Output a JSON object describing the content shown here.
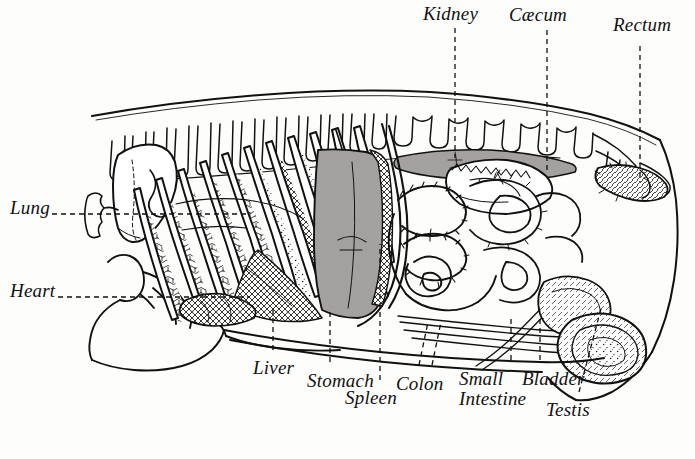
{
  "figure": {
    "background_color": "#fdfdfb",
    "ink_color": "#121110",
    "width": 695,
    "height": 459,
    "style": "engraved line drawing, italic serif labels with dashed leader lines"
  },
  "labels": [
    {
      "id": "kidney",
      "text": "Kidney",
      "x": 423,
      "y": 4,
      "align": "left"
    },
    {
      "id": "caecum",
      "text": "Cæcum",
      "x": 509,
      "y": 5,
      "align": "left"
    },
    {
      "id": "rectum",
      "text": "Rectum",
      "x": 613,
      "y": 15,
      "align": "left"
    },
    {
      "id": "lung",
      "text": "Lung",
      "x": 10,
      "y": 198,
      "align": "left"
    },
    {
      "id": "heart",
      "text": "Heart",
      "x": 10,
      "y": 281,
      "align": "left"
    },
    {
      "id": "liver",
      "text": "Liver",
      "x": 253,
      "y": 358,
      "align": "left"
    },
    {
      "id": "stomach",
      "text": "Stomach",
      "x": 307,
      "y": 371,
      "align": "left"
    },
    {
      "id": "spleen",
      "text": "Spleen",
      "x": 345,
      "y": 388,
      "align": "left"
    },
    {
      "id": "colon",
      "text": "Colon",
      "x": 396,
      "y": 374,
      "align": "left"
    },
    {
      "id": "small-intestine",
      "text": "Small\nIntestine",
      "x": 459,
      "y": 369,
      "align": "left"
    },
    {
      "id": "bladder",
      "text": "Bladder",
      "x": 522,
      "y": 369,
      "align": "left"
    },
    {
      "id": "testis",
      "text": "Testis",
      "x": 546,
      "y": 400,
      "align": "left"
    }
  ],
  "leader_lines": [
    {
      "id": "kidney-leader",
      "from": [
        455,
        28
      ],
      "to": [
        455,
        158
      ],
      "style": "dashed"
    },
    {
      "id": "caecum-leader",
      "from": [
        547,
        30
      ],
      "to": [
        547,
        170
      ],
      "style": "dashed"
    },
    {
      "id": "rectum-leader",
      "from": [
        640,
        46
      ],
      "to": [
        640,
        182
      ],
      "style": "dashed"
    },
    {
      "id": "lung-leader",
      "from": [
        52,
        214
      ],
      "to": [
        250,
        214
      ],
      "style": "dashed"
    },
    {
      "id": "heart-leader",
      "from": [
        58,
        297
      ],
      "to": [
        250,
        297
      ],
      "style": "dashed"
    },
    {
      "id": "liver-leader",
      "from": [
        273,
        350
      ],
      "to": [
        273,
        306
      ],
      "style": "dashed"
    },
    {
      "id": "stomach-leader",
      "from": [
        330,
        362
      ],
      "to": [
        330,
        312
      ],
      "style": "dashed"
    },
    {
      "id": "spleen-leader",
      "from": [
        380,
        380
      ],
      "to": [
        380,
        244
      ],
      "style": "dashed"
    },
    {
      "id": "colon-leader-a",
      "from": [
        419,
        365
      ],
      "to": [
        428,
        322
      ],
      "style": "dashed"
    },
    {
      "id": "colon-leader-b",
      "from": [
        432,
        365
      ],
      "to": [
        441,
        322
      ],
      "style": "dashed"
    },
    {
      "id": "small-intestine-leader",
      "from": [
        511,
        360
      ],
      "to": [
        511,
        318
      ],
      "style": "dashed"
    },
    {
      "id": "bladder-leader",
      "from": [
        540,
        360
      ],
      "to": [
        540,
        316
      ],
      "style": "dashed"
    },
    {
      "id": "testis-leader",
      "from": [
        579,
        392
      ],
      "to": [
        602,
        305
      ],
      "style": "dashed"
    }
  ],
  "organs": [
    {
      "id": "lung",
      "name": "Lung"
    },
    {
      "id": "heart",
      "name": "Heart"
    },
    {
      "id": "liver",
      "name": "Liver"
    },
    {
      "id": "stomach",
      "name": "Stomach"
    },
    {
      "id": "spleen",
      "name": "Spleen"
    },
    {
      "id": "kidney",
      "name": "Kidney"
    },
    {
      "id": "caecum",
      "name": "Cæcum"
    },
    {
      "id": "colon",
      "name": "Colon"
    },
    {
      "id": "small-intestine",
      "name": "Small Intestine"
    },
    {
      "id": "bladder",
      "name": "Bladder"
    },
    {
      "id": "rectum",
      "name": "Rectum"
    },
    {
      "id": "testis",
      "name": "Testis"
    }
  ]
}
